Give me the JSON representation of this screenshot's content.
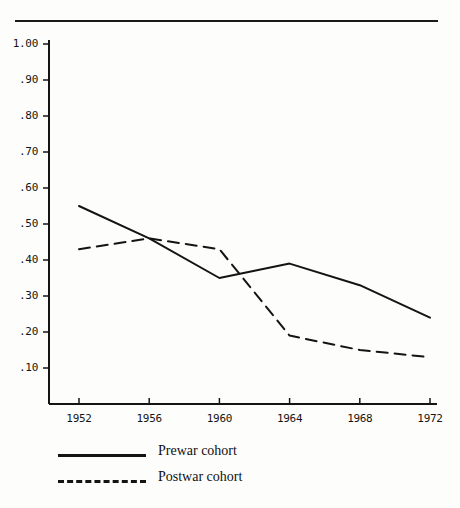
{
  "chart_data": {
    "type": "line",
    "title": "",
    "subtitle": "",
    "xlabel": "",
    "ylabel": "",
    "x": [
      1952,
      1956,
      1960,
      1964,
      1968,
      1972
    ],
    "xtick_labels": [
      "1952",
      "1956",
      "1960",
      "1964",
      "1968",
      "1972"
    ],
    "ytick_labels": [
      "1.00",
      ".90",
      ".80",
      ".70",
      ".60",
      ".50",
      ".40",
      ".30",
      ".20",
      ".10"
    ],
    "ytick_values": [
      1.0,
      0.9,
      0.8,
      0.7,
      0.6,
      0.5,
      0.4,
      0.3,
      0.2,
      0.1
    ],
    "ylim": [
      0.0,
      1.0
    ],
    "xlim": [
      1952,
      1972
    ],
    "grid": false,
    "legend_position": "below-left",
    "series": [
      {
        "name": "Prewar cohort",
        "style": "solid",
        "color": "#141414",
        "values": [
          0.55,
          0.46,
          0.35,
          0.39,
          0.33,
          0.24
        ]
      },
      {
        "name": "Postwar cohort",
        "style": "dashed",
        "color": "#141414",
        "values": [
          0.43,
          0.46,
          0.43,
          0.19,
          0.15,
          0.13
        ]
      }
    ]
  },
  "legend": {
    "items": [
      {
        "label": "Prewar cohort",
        "style": "solid"
      },
      {
        "label": "Postwar cohort",
        "style": "dashed"
      }
    ]
  },
  "axes": {
    "y": {
      "labels": [
        "1.00",
        ".90",
        ".80",
        ".70",
        ".60",
        ".50",
        ".40",
        ".30",
        ".20",
        ".10"
      ]
    },
    "x": {
      "labels": [
        "1952",
        "1956",
        "1960",
        "1964",
        "1968",
        "1972"
      ]
    }
  }
}
